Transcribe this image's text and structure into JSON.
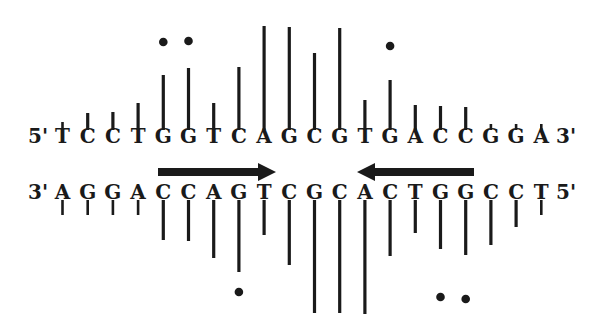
{
  "figure": {
    "type": "dna_cleavage_pattern",
    "top_strand": {
      "five_prime_label": "5'",
      "three_prime_label": "3'",
      "sequence": [
        "T",
        "C",
        "C",
        "T",
        "G",
        "G",
        "T",
        "C",
        "A",
        "G",
        "C",
        "G",
        "T",
        "G",
        "A",
        "C",
        "C",
        "G",
        "G",
        "A"
      ]
    },
    "bottom_strand": {
      "three_prime_label": "3'",
      "five_prime_label": "5'",
      "sequence": [
        "A",
        "G",
        "G",
        "A",
        "C",
        "C",
        "A",
        "G",
        "T",
        "C",
        "G",
        "C",
        "A",
        "C",
        "T",
        "G",
        "G",
        "C",
        "C",
        "T"
      ]
    },
    "top_bars_y_top": [
      122,
      113,
      112,
      103,
      75,
      68,
      103,
      67,
      26,
      27,
      53,
      28,
      100,
      80,
      105,
      106,
      107,
      124,
      124,
      124
    ],
    "top_dots": [
      4,
      5,
      13
    ],
    "bottom_bars_y_bottom": [
      215,
      215,
      215,
      215,
      240,
      241,
      258,
      272,
      235,
      265,
      313,
      313,
      314,
      256,
      233,
      249,
      255,
      245,
      227,
      215
    ],
    "bottom_dots": [
      7,
      15,
      16
    ],
    "arrows": [
      {
        "direction": "right",
        "x_start": 158,
        "x_end": 276
      },
      {
        "direction": "left",
        "x_start": 357,
        "x_end": 474
      }
    ]
  }
}
